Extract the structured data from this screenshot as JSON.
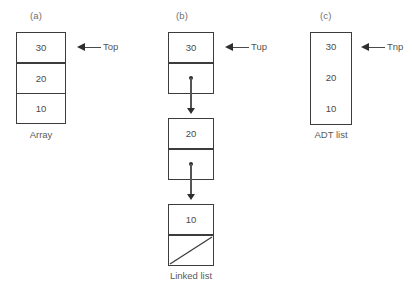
{
  "figure": {
    "background": "#ffffff",
    "border_color": "#3c3c3c",
    "text_color": "#4a4a4a"
  },
  "panels": [
    {
      "letter": "(a)",
      "caption": "Array",
      "pointer_label": "Top",
      "values": [
        "30",
        "20",
        "10"
      ]
    },
    {
      "letter": "(b)",
      "caption": "Linked list",
      "pointer_label": "Tup",
      "values": [
        "30",
        "20",
        "10"
      ]
    },
    {
      "letter": "(c)",
      "caption": "ADT list",
      "pointer_label": "Tnp",
      "values": [
        "30",
        "20",
        "10"
      ]
    }
  ]
}
